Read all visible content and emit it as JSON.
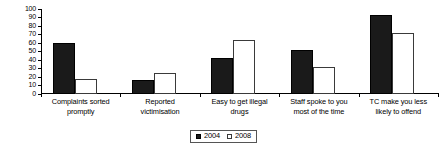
{
  "chart_data": {
    "type": "bar",
    "title": "",
    "subtitle": "",
    "xlabel": "",
    "ylabel": "",
    "ylim": [
      0,
      100
    ],
    "yticks": [
      0,
      10,
      20,
      30,
      40,
      50,
      60,
      70,
      80,
      90,
      100
    ],
    "ytick_labels": [
      "0",
      "10",
      "20",
      "30",
      "40",
      "50",
      "60",
      "70",
      "80",
      "90",
      "100"
    ],
    "grid": false,
    "legend_position": "bottom-center",
    "categories": [
      "Complaints sorted promptly",
      "Reported victimisation",
      "Easy to get illegal drugs",
      "Staff spoke to you most of the time",
      "TC make you less likely to offend"
    ],
    "category_lines": [
      [
        "Complaints sorted",
        "promptly"
      ],
      [
        "Reported",
        "victimisation"
      ],
      [
        "Easy to get illegal",
        "drugs"
      ],
      [
        "Staff spoke to you",
        "most of the time"
      ],
      [
        "TC make you less",
        "likely to offend"
      ]
    ],
    "series": [
      {
        "name": "2004",
        "color": "#1a1a1a",
        "fill": "solid",
        "values": [
          60,
          16,
          42,
          52,
          93
        ]
      },
      {
        "name": "2008",
        "color": "#ffffff",
        "fill": "hollow",
        "values": [
          18,
          25,
          64,
          32,
          72
        ]
      }
    ]
  },
  "legend": {
    "items": [
      {
        "label": "2004",
        "swatch": "filled-square-icon"
      },
      {
        "label": "2008",
        "swatch": "hollow-square-icon"
      }
    ]
  }
}
